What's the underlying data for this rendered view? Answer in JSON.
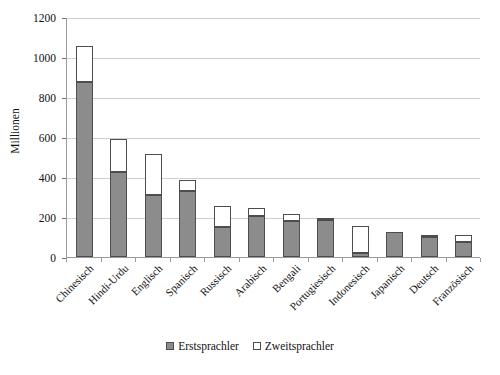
{
  "chart_data": {
    "type": "bar",
    "subtype": "stacked-vertical-bar",
    "title": "",
    "xlabel": "",
    "ylabel": "Millionen",
    "ylim": [
      0,
      1200
    ],
    "ytick_step": 200,
    "yticks": [
      0,
      200,
      400,
      600,
      800,
      1000,
      1200
    ],
    "ytick_labels": [
      "0",
      "200",
      "400",
      "600",
      "800",
      "1000",
      "1200"
    ],
    "grid": true,
    "grid_axis": "y",
    "legend_position": "bottom-center",
    "categories": [
      "Chinesisch",
      "Hindi-Urdu",
      "Englisch",
      "Spanisch",
      "Russisch",
      "Arabisch",
      "Bengali",
      "Portugiesisch",
      "Indonesisch",
      "Japanisch",
      "Deutsch",
      "Französisch"
    ],
    "series": [
      {
        "name": "Erstsprachler",
        "color": "#8c8c8c",
        "values": [
          875,
          425,
          310,
          330,
          150,
          205,
          180,
          185,
          20,
          125,
          100,
          75
        ]
      },
      {
        "name": "Zweitsprachler",
        "color": "#ffffff",
        "values": [
          180,
          165,
          205,
          55,
          105,
          40,
          35,
          10,
          135,
          0,
          10,
          35
        ]
      }
    ],
    "totals": [
      1055,
      590,
      515,
      385,
      255,
      245,
      215,
      195,
      155,
      125,
      110,
      110
    ]
  },
  "legend": {
    "items": [
      {
        "label": "Erstsprachler",
        "swatch": "filled-gray-swatch"
      },
      {
        "label": "Zweitsprachler",
        "swatch": "outlined-white-swatch"
      }
    ]
  },
  "axes": {
    "y_title": "Millionen"
  }
}
